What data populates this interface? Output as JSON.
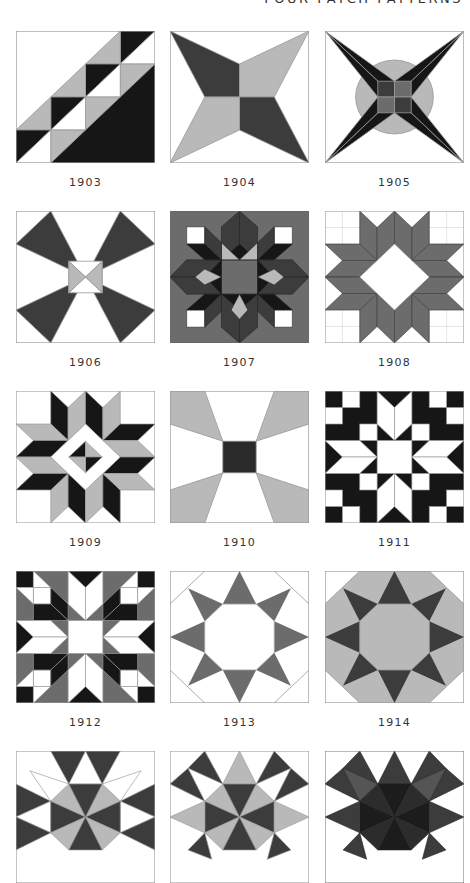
{
  "page": {
    "header": "FOUR-PATCH PATTERNS",
    "colors": {
      "black": "#161616",
      "dark": "#3c3c3c",
      "mid": "#6c6c6c",
      "light": "#b9b9b9",
      "white": "#ffffff",
      "line": "#9a9a9a"
    }
  },
  "blocks": [
    {
      "id": "1903",
      "label": "1903"
    },
    {
      "id": "1904",
      "label": "1904"
    },
    {
      "id": "1905",
      "label": "1905"
    },
    {
      "id": "1906",
      "label": "1906"
    },
    {
      "id": "1907",
      "label": "1907"
    },
    {
      "id": "1908",
      "label": "1908"
    },
    {
      "id": "1909",
      "label": "1909"
    },
    {
      "id": "1910",
      "label": "1910"
    },
    {
      "id": "1911",
      "label": "1911"
    },
    {
      "id": "1912",
      "label": "1912"
    },
    {
      "id": "1913",
      "label": "1913"
    },
    {
      "id": "1914",
      "label": "1914"
    },
    {
      "id": "1915",
      "label": ""
    },
    {
      "id": "1916",
      "label": ""
    },
    {
      "id": "1917",
      "label": ""
    }
  ]
}
